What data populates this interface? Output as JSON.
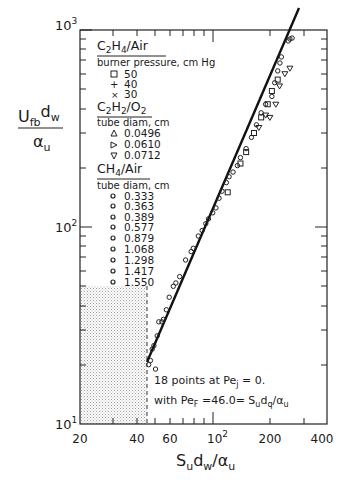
{
  "chart_data": {
    "type": "scatter",
    "title": "",
    "xlabel": "S_u d_w / α_u",
    "ylabel": "U_fb d_w / α_u",
    "xscale": "log",
    "yscale": "log",
    "xlim": [
      20,
      400
    ],
    "ylim": [
      10,
      1000
    ],
    "x_ticks": [
      "20",
      "40",
      "60",
      "10²",
      "200",
      "400"
    ],
    "x_tick_values": [
      20,
      40,
      60,
      100,
      200,
      400
    ],
    "y_ticks": [
      "10¹",
      "10²",
      "10³"
    ],
    "y_tick_values": [
      10,
      100,
      1000
    ],
    "grid": false,
    "legend_position": "upper-left",
    "legend": {
      "groups": [
        {
          "title_main": "C",
          "title": "C2H4/Air",
          "subtitle": "burner pressure, cm Hg",
          "entries": [
            {
              "marker": "square",
              "label": "50"
            },
            {
              "marker": "plus",
              "label": "40"
            },
            {
              "marker": "x",
              "label": "30"
            }
          ]
        },
        {
          "title": "C2H2/O2",
          "subtitle": "tube diam, cm",
          "entries": [
            {
              "marker": "triangle-up",
              "label": "0.0496"
            },
            {
              "marker": "triangle-right",
              "label": "0.0610"
            },
            {
              "marker": "triangle-down",
              "label": "0.0712"
            }
          ]
        },
        {
          "title": "CH4/Air",
          "subtitle": "tube diam, cm",
          "entries": [
            {
              "marker": "circle",
              "label": "0.333"
            },
            {
              "marker": "circle",
              "label": "0.363"
            },
            {
              "marker": "circle",
              "label": "0.389"
            },
            {
              "marker": "circle",
              "label": "0.577"
            },
            {
              "marker": "circle",
              "label": "0.879"
            },
            {
              "marker": "circle",
              "label": "1.068"
            },
            {
              "marker": "circle",
              "label": "1.298"
            },
            {
              "marker": "circle",
              "label": "1.417"
            },
            {
              "marker": "circle",
              "label": "1.550"
            }
          ]
        }
      ]
    },
    "fit_line": {
      "x": [
        46,
        300
      ],
      "y": [
        15,
        1000
      ]
    },
    "shaded_region": {
      "x": [
        20,
        46
      ],
      "y": [
        10,
        48
      ],
      "pattern": "stipple"
    },
    "vertical_dashed_line_x": 46,
    "annotations": [
      "18 points at Pe_j = 0.",
      "with Pe_F = 46.0 = S_u d_q / α_u"
    ],
    "series": [
      {
        "name": "CH4/Air",
        "marker": "circle",
        "points": [
          [
            46,
            20
          ],
          [
            47,
            21
          ],
          [
            48,
            24
          ],
          [
            49,
            25
          ],
          [
            50,
            19
          ],
          [
            51,
            28
          ],
          [
            52,
            33
          ],
          [
            54,
            33
          ],
          [
            55,
            34
          ],
          [
            57,
            38
          ],
          [
            59,
            44
          ],
          [
            62,
            50
          ],
          [
            64,
            52
          ],
          [
            67,
            56
          ],
          [
            72,
            68
          ],
          [
            77,
            75
          ],
          [
            79,
            78
          ],
          [
            84,
            90
          ],
          [
            88,
            96
          ],
          [
            92,
            104
          ],
          [
            95,
            110
          ],
          [
            100,
            118
          ],
          [
            104,
            125
          ],
          [
            108,
            140
          ],
          [
            112,
            152
          ],
          [
            118,
            168
          ],
          [
            122,
            180
          ],
          [
            128,
            190
          ],
          [
            135,
            205
          ],
          [
            140,
            225
          ],
          [
            150,
            250
          ],
          [
            160,
            285
          ],
          [
            170,
            330
          ],
          [
            180,
            380
          ],
          [
            190,
            420
          ],
          [
            205,
            460
          ],
          [
            212,
            540
          ],
          [
            220,
            620
          ],
          [
            226,
            680
          ],
          [
            230,
            730
          ],
          [
            250,
            880
          ],
          [
            255,
            900
          ],
          [
            262,
            910
          ]
        ]
      },
      {
        "name": "C2H4/Air",
        "marker": "square",
        "points": [
          [
            120,
            150
          ],
          [
            140,
            210
          ],
          [
            150,
            240
          ],
          [
            165,
            300
          ],
          [
            180,
            360
          ],
          [
            195,
            420
          ],
          [
            205,
            490
          ],
          [
            220,
            560
          ]
        ]
      },
      {
        "name": "C2H2/O2",
        "marker": "triangle",
        "points": [
          [
            175,
            320
          ],
          [
            190,
            370
          ],
          [
            200,
            360
          ],
          [
            215,
            420
          ],
          [
            225,
            520
          ],
          [
            240,
            600
          ],
          [
            255,
            640
          ]
        ]
      }
    ]
  },
  "axes": {
    "y_label_main": "U",
    "y_label_sub1": "fb",
    "y_label_mid": "d",
    "y_label_sub2": "w",
    "y_label_den": "α",
    "y_label_den_sub": "u",
    "x_label_main": "S",
    "x_label_sub1": "u",
    "x_label_mid": "d",
    "x_label_sub2": "w",
    "x_label_slash": "/α",
    "x_label_sub3": "u",
    "y_tick_10": "10",
    "y_tick_10_exp": "1",
    "y_tick_100": "10",
    "y_tick_100_exp": "2",
    "y_tick_1000": "10",
    "y_tick_1000_exp": "3",
    "x_tick_20": "20",
    "x_tick_40": "40",
    "x_tick_60": "60",
    "x_tick_100": "10",
    "x_tick_100_exp": "2",
    "x_tick_200": "200",
    "x_tick_400": "400"
  },
  "legend_text": {
    "g1_title_a": "C",
    "g1_title_s1": "2",
    "g1_title_b": "H",
    "g1_title_s2": "4",
    "g1_title_c": "/Air",
    "g1_sub": "burner pressure, cm Hg",
    "g1_e1": "50",
    "g1_e2": "40",
    "g1_e3": "30",
    "g2_title_a": "C",
    "g2_title_s1": "2",
    "g2_title_b": "H",
    "g2_title_s2": "2",
    "g2_title_c": "/O",
    "g2_title_s3": "2",
    "g2_sub": "tube diam, cm",
    "g2_e1": "0.0496",
    "g2_e2": "0.0610",
    "g2_e3": "0.0712",
    "g3_title_a": "CH",
    "g3_title_s1": "4",
    "g3_title_b": "/Air",
    "g3_sub": "tube diam, cm",
    "g3_e1": "0.333",
    "g3_e2": "0.363",
    "g3_e3": "0.389",
    "g3_e4": "0.577",
    "g3_e5": "0.879",
    "g3_e6": "1.068",
    "g3_e7": "1.298",
    "g3_e8": "1.417",
    "g3_e9": "1.550"
  },
  "annotation_text": {
    "line1_a": "18 points at Pe",
    "line1_sub": "j",
    "line1_b": " = 0.",
    "line2_a": "with  Pe",
    "line2_sub": "F",
    "line2_b": " =46.0= S",
    "line2_sub2": "u",
    "line2_c": "d",
    "line2_sub3": "q",
    "line2_d": "/α",
    "line2_sub4": "u"
  }
}
